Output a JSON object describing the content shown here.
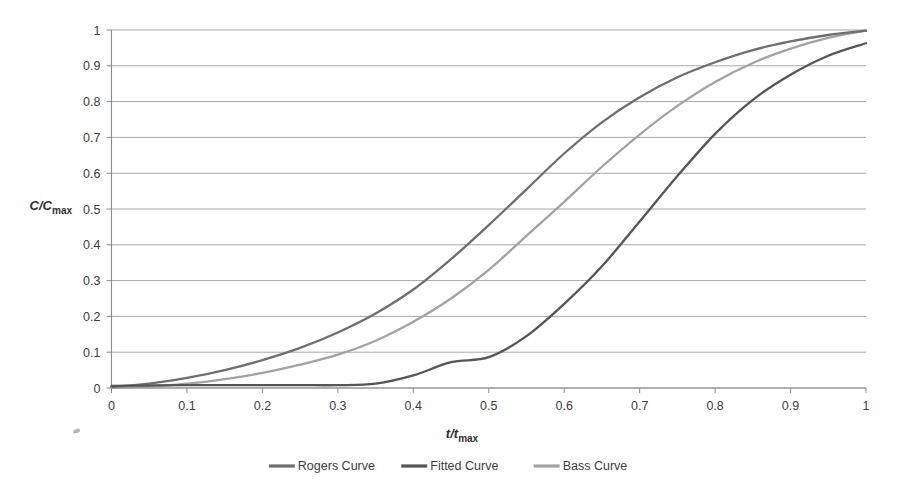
{
  "chart_data": {
    "type": "line",
    "title": "",
    "xlabel": "t/t_max",
    "ylabel": "C/C_max",
    "xlabel_parts": {
      "main": "t/t",
      "sub": "max"
    },
    "ylabel_parts": {
      "main": "C/C",
      "sub": "max"
    },
    "xlim": [
      0,
      1
    ],
    "ylim": [
      0,
      1
    ],
    "grid": "horizontal",
    "legend_position": "bottom-center",
    "x_ticks": [
      "0",
      "0.1",
      "0.2",
      "0.3",
      "0.4",
      "0.5",
      "0.6",
      "0.7",
      "0.8",
      "0.9",
      "1"
    ],
    "y_ticks": [
      "0",
      "0.1",
      "0.2",
      "0.3",
      "0.4",
      "0.5",
      "0.6",
      "0.7",
      "0.8",
      "0.9",
      "1"
    ],
    "x": [
      0,
      0.05,
      0.1,
      0.15,
      0.2,
      0.25,
      0.3,
      0.35,
      0.4,
      0.45,
      0.5,
      0.55,
      0.6,
      0.65,
      0.7,
      0.75,
      0.8,
      0.85,
      0.9,
      0.95,
      1
    ],
    "series": [
      {
        "name": "Rogers Curve",
        "color": "#6e6e6e",
        "values": [
          0.003,
          0.012,
          0.028,
          0.05,
          0.078,
          0.112,
          0.155,
          0.208,
          0.275,
          0.36,
          0.455,
          0.555,
          0.655,
          0.742,
          0.812,
          0.868,
          0.91,
          0.944,
          0.968,
          0.986,
          0.998
        ]
      },
      {
        "name": "Fitted Curve",
        "color": "#555555",
        "values": [
          0.006,
          0.007,
          0.008,
          0.008,
          0.008,
          0.008,
          0.008,
          0.012,
          0.035,
          0.072,
          0.086,
          0.145,
          0.235,
          0.34,
          0.465,
          0.592,
          0.71,
          0.805,
          0.875,
          0.928,
          0.963
        ]
      },
      {
        "name": "Bass Curve",
        "color": "#a2a2a2",
        "values": [
          0.001,
          0.004,
          0.012,
          0.025,
          0.042,
          0.065,
          0.093,
          0.132,
          0.185,
          0.25,
          0.33,
          0.425,
          0.52,
          0.618,
          0.708,
          0.788,
          0.855,
          0.908,
          0.948,
          0.978,
          0.998
        ]
      }
    ],
    "legend": [
      {
        "label": "Rogers Curve",
        "color": "#6e6e6e"
      },
      {
        "label": "Fitted Curve",
        "color": "#555555"
      },
      {
        "label": "Bass Curve",
        "color": "#a2a2a2"
      }
    ],
    "colors": {
      "gridline": "#9d9d9d",
      "axis": "#8a8a8a",
      "background": "#ffffff",
      "text": "#3c3c3c"
    }
  }
}
